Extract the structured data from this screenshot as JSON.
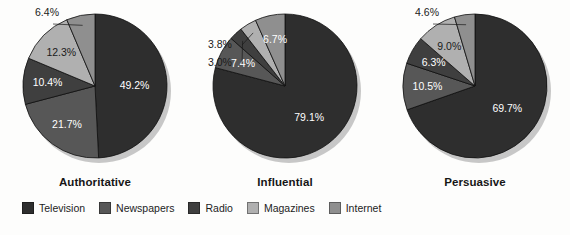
{
  "chart_data": [
    {
      "type": "pie",
      "title": "Authoritative",
      "categories": [
        "Television",
        "Newspapers",
        "Radio",
        "Magazines",
        "Internet"
      ],
      "values": [
        49.2,
        21.7,
        10.4,
        12.3,
        6.4
      ],
      "labels": [
        "49.2%",
        "21.7%",
        "10.4%",
        "12.3%",
        "6.4%"
      ],
      "callout": [
        "Internet"
      ],
      "legend_position": "bottom",
      "grid": false
    },
    {
      "type": "pie",
      "title": "Influential",
      "categories": [
        "Television",
        "Newspapers",
        "Radio",
        "Magazines",
        "Internet"
      ],
      "values": [
        79.1,
        7.4,
        3.0,
        3.8,
        6.7
      ],
      "labels": [
        "79.1%",
        "7.4%",
        "3.0%",
        "3.8%",
        "6.7%"
      ],
      "callout": [
        "Radio",
        "Magazines"
      ],
      "legend_position": "bottom",
      "grid": false
    },
    {
      "type": "pie",
      "title": "Persuasive",
      "categories": [
        "Television",
        "Newspapers",
        "Radio",
        "Magazines",
        "Internet"
      ],
      "values": [
        69.7,
        10.5,
        6.3,
        9.0,
        4.6
      ],
      "labels": [
        "69.7%",
        "10.5%",
        "6.3%",
        "9.0%",
        "4.6%"
      ],
      "callout": [
        "Internet"
      ],
      "legend_position": "bottom",
      "grid": false
    }
  ],
  "legend": {
    "items": [
      {
        "label": "Television",
        "color": "#2e2e2e"
      },
      {
        "label": "Newspapers",
        "color": "#575757"
      },
      {
        "label": "Radio",
        "color": "#3f3f3f"
      },
      {
        "label": "Magazines",
        "color": "#b0b0b0"
      },
      {
        "label": "Internet",
        "color": "#8f8f8f"
      }
    ]
  },
  "colors": {
    "Television": "#2e2e2e",
    "Newspapers": "#575757",
    "Radio": "#3f3f3f",
    "Magazines": "#b0b0b0",
    "Internet": "#8f8f8f",
    "shadow": "#9a9a9a",
    "background": "#fdfdfc",
    "text": "#1a1a1a"
  },
  "panels": [
    {
      "title_bind": "chart_data.0.title",
      "left": 0
    },
    {
      "title_bind": "chart_data.1.title",
      "left": 190
    },
    {
      "title_bind": "chart_data.2.title",
      "left": 380
    }
  ]
}
